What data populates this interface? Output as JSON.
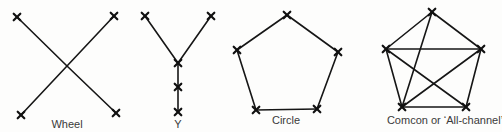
{
  "diagrams": [
    {
      "id": "wheel",
      "label": "Wheel",
      "label_pos": [
        67,
        118
      ],
      "nodes": [
        [
          17,
          17
        ],
        [
          114,
          16
        ],
        [
          67,
          66
        ],
        [
          21,
          115
        ],
        [
          116,
          113
        ]
      ],
      "edges": [
        [
          0,
          2
        ],
        [
          2,
          4
        ],
        [
          1,
          2
        ],
        [
          2,
          3
        ]
      ],
      "marked_nodes": [
        0,
        1,
        3,
        4
      ]
    },
    {
      "id": "y",
      "label": "Y",
      "label_pos": [
        178,
        118
      ],
      "nodes": [
        [
          145,
          16
        ],
        [
          211,
          16
        ],
        [
          178,
          63
        ],
        [
          178,
          87
        ],
        [
          178,
          112
        ]
      ],
      "edges": [
        [
          0,
          2
        ],
        [
          1,
          2
        ],
        [
          2,
          3
        ],
        [
          3,
          4
        ]
      ],
      "marked_nodes": [
        0,
        1,
        2,
        3,
        4
      ]
    },
    {
      "id": "circle",
      "label": "Circle",
      "label_pos": [
        286,
        114
      ],
      "nodes": [
        [
          287,
          15
        ],
        [
          338,
          52
        ],
        [
          317,
          109
        ],
        [
          256,
          110
        ],
        [
          237,
          50
        ]
      ],
      "edges": [
        [
          0,
          1
        ],
        [
          1,
          2
        ],
        [
          2,
          3
        ],
        [
          3,
          4
        ],
        [
          4,
          0
        ]
      ],
      "marked_nodes": [
        0,
        1,
        2,
        3,
        4
      ]
    },
    {
      "id": "comcon",
      "label": "Comcon or ‘All-channel’",
      "label_pos": [
        445,
        114
      ],
      "nodes": [
        [
          432,
          12
        ],
        [
          481,
          49
        ],
        [
          466,
          107
        ],
        [
          402,
          107
        ],
        [
          386,
          49
        ]
      ],
      "edges": [
        [
          0,
          1
        ],
        [
          1,
          2
        ],
        [
          2,
          3
        ],
        [
          3,
          4
        ],
        [
          4,
          0
        ],
        [
          0,
          3
        ],
        [
          4,
          1
        ],
        [
          4,
          2
        ],
        [
          3,
          1
        ]
      ],
      "marked_nodes": [
        0,
        1,
        2,
        3,
        4
      ]
    }
  ],
  "style": {
    "line_color": "#161616",
    "label_color": "#3a3a3a",
    "background": "#fdfdfc"
  }
}
